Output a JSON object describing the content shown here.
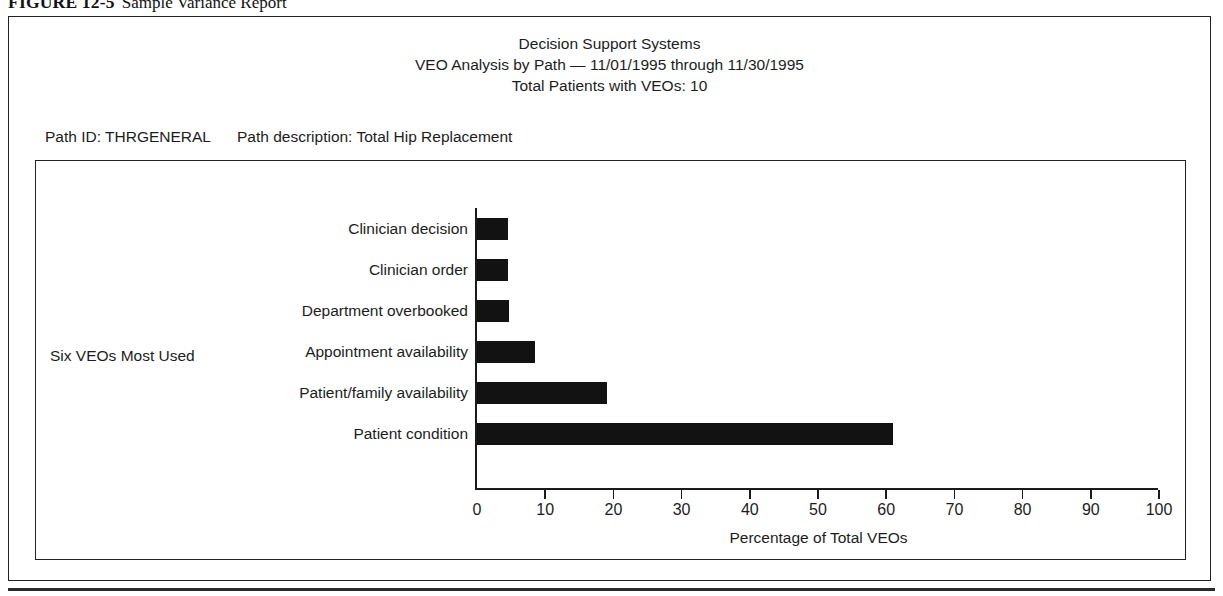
{
  "figure": {
    "number": "FIGURE 12-5",
    "caption": "Sample Variance Report"
  },
  "report": {
    "title_line1": "Decision Support Systems",
    "title_line2": "VEO Analysis by Path — 11/01/1995 through 11/30/1995",
    "title_line3": "Total Patients with VEOs: 10",
    "path_id_label": "Path ID: THRGENERAL",
    "path_description_label": "Path description: Total Hip Replacement"
  },
  "chart_data": {
    "type": "bar",
    "orientation": "horizontal",
    "title": "Decision Support Systems",
    "subtitle": "VEO Analysis by Path — 11/01/1995 through 11/30/1995",
    "xlabel": "Percentage of Total VEOs",
    "ylabel": "Six VEOs Most Used",
    "xlim": [
      0,
      100
    ],
    "xticks": [
      0,
      10,
      20,
      30,
      40,
      50,
      60,
      70,
      80,
      90,
      100
    ],
    "grid": false,
    "legend": false,
    "bar_color": "#121212",
    "categories": [
      "Clinician decision",
      "Clinician order",
      "Department overbooked",
      "Appointment availability",
      "Patient/family availability",
      "Patient condition"
    ],
    "values": [
      4.5,
      4.5,
      4.7,
      8.5,
      19.0,
      61.0
    ]
  },
  "colors": {
    "frame": "#222222",
    "text": "#1c1c1c",
    "bar": "#121212"
  }
}
